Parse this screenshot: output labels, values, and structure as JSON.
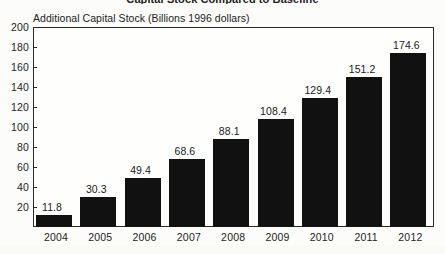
{
  "chart_data": {
    "type": "bar",
    "title": "Capital Stock Compared to Baseline",
    "axis_title": "Additional Capital Stock (Billions 1996 dollars)",
    "xlabel": "",
    "ylabel": "Additional Capital Stock (Billions 1996 dollars)",
    "categories": [
      "2004",
      "2005",
      "2006",
      "2007",
      "2008",
      "2009",
      "2010",
      "2011",
      "2012"
    ],
    "values": [
      11.8,
      30.3,
      49.4,
      68.6,
      88.1,
      108.4,
      129.4,
      151.2,
      174.6
    ],
    "value_labels": [
      "11.8",
      "30.3",
      "49.4",
      "68.6",
      "88.1",
      "108.4",
      "129.4",
      "151.2",
      "174.6"
    ],
    "ylim": [
      0,
      200
    ],
    "ytick_labels": [
      "200",
      "180",
      "160",
      "140",
      "120",
      "100",
      "80",
      "60",
      "40",
      "20"
    ],
    "ytick_values": [
      200,
      180,
      160,
      140,
      120,
      100,
      80,
      60,
      40,
      20
    ],
    "grid": false,
    "legend": false,
    "legend_position": "none",
    "bar_color": "#111111",
    "frame_color": "#2b2b2b",
    "background_color": "#fcfcfa"
  }
}
